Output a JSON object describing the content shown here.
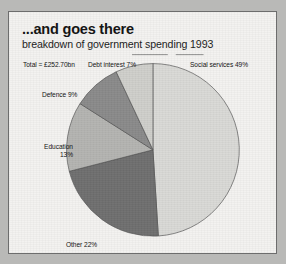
{
  "figure": {
    "title": "...and goes there",
    "subtitle": "breakdown of government spending 1993",
    "total_label": "Total = £252.70bn",
    "background_color": "#f3f2f0",
    "border_color": "#6d6d6d",
    "outer_color": "#b9b9b7"
  },
  "chart_data": {
    "type": "pie",
    "title": "...and goes there",
    "subtitle": "breakdown of government spending 1993",
    "xlabel": "",
    "ylabel": "",
    "total": 252.7,
    "total_units": "£bn",
    "total_text": "Total = £252.70bn",
    "legend_position": "callout-labels",
    "grid": false,
    "categories": [
      "Social services",
      "Other",
      "Education",
      "Defence",
      "Debt interest"
    ],
    "values": [
      49,
      22,
      13,
      9,
      7
    ],
    "value_units": "percent",
    "slices": [
      {
        "label": "Social services 49%",
        "name": "Social services",
        "value": 49,
        "color": "#d9d9d6",
        "start_deg": 0,
        "sweep_deg": 176.4,
        "label_pos": "right-top"
      },
      {
        "label": "Other 22%",
        "name": "Other",
        "value": 22,
        "color": "#6f6f6f",
        "start_deg": 176.4,
        "sweep_deg": 79.2,
        "label_pos": "bottom-left"
      },
      {
        "label": "Education 13%",
        "name": "Education",
        "value": 13,
        "color": "#b4b4b1",
        "start_deg": 255.6,
        "sweep_deg": 46.8,
        "label_pos": "left"
      },
      {
        "label": "Defence 9%",
        "name": "Defence",
        "value": 9,
        "color": "#8a8a8a",
        "start_deg": 302.4,
        "sweep_deg": 32.4,
        "label_pos": "upper-left"
      },
      {
        "label": "Debt interest 7%",
        "name": "Debt interest",
        "value": 7,
        "color": "#cfcfcb",
        "start_deg": 334.8,
        "sweep_deg": 25.2,
        "label_pos": "top"
      }
    ],
    "labels": {
      "social": "Social services 49%",
      "other": "Other 22%",
      "education_line1": "Education",
      "education_line2": "13%",
      "defence": "Defence 9%",
      "debt": "Debt interest 7%"
    }
  }
}
